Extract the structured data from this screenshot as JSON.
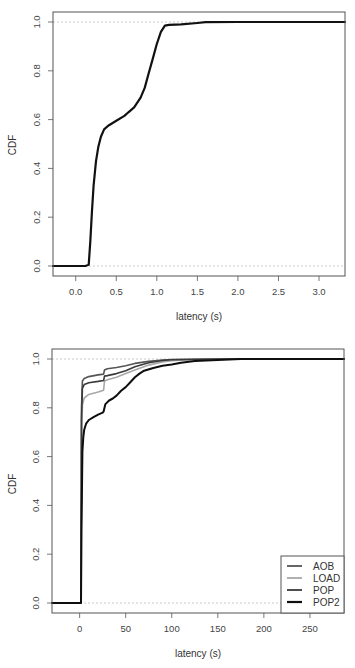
{
  "chart_data": [
    {
      "type": "line",
      "title": "",
      "xlabel": "latency (s)",
      "ylabel": "CDF",
      "xlim": [
        -0.28,
        3.32
      ],
      "ylim": [
        -0.04,
        1.04
      ],
      "xticks": [
        0.0,
        0.5,
        1.0,
        1.5,
        2.0,
        2.5,
        3.0
      ],
      "xtick_labels": [
        "0.0",
        "0.5",
        "1.0",
        "1.5",
        "2.0",
        "2.5",
        "3.0"
      ],
      "yticks": [
        0.0,
        0.2,
        0.4,
        0.6,
        0.8,
        1.0
      ],
      "ytick_labels": [
        "0.0",
        "0.2",
        "0.4",
        "0.6",
        "0.8",
        "1.0"
      ],
      "grid": false,
      "reference_lines": [
        0.0,
        1.0
      ],
      "legend": null,
      "series": [
        {
          "name": "CDF",
          "color": "#111111",
          "width": 2.2,
          "x": [
            -0.28,
            0.0,
            0.12,
            0.16,
            0.18,
            0.2,
            0.22,
            0.25,
            0.28,
            0.31,
            0.35,
            0.4,
            0.5,
            0.6,
            0.65,
            0.72,
            0.8,
            0.85,
            0.9,
            0.95,
            1.0,
            1.05,
            1.1,
            1.15,
            1.3,
            1.5,
            1.6,
            2.0,
            3.32
          ],
          "y": [
            0.0,
            0.0,
            0.0,
            0.005,
            0.1,
            0.22,
            0.33,
            0.43,
            0.49,
            0.53,
            0.56,
            0.575,
            0.595,
            0.615,
            0.63,
            0.65,
            0.69,
            0.73,
            0.79,
            0.85,
            0.91,
            0.96,
            0.985,
            0.988,
            0.99,
            0.996,
            0.999,
            1.0,
            1.0
          ]
        }
      ]
    },
    {
      "type": "line",
      "title": "",
      "xlabel": "latency (s)",
      "ylabel": "CDF",
      "xlim": [
        -30,
        287
      ],
      "ylim": [
        -0.04,
        1.04
      ],
      "xticks": [
        0,
        50,
        100,
        150,
        200,
        250
      ],
      "xtick_labels": [
        "0",
        "50",
        "100",
        "150",
        "200",
        "250"
      ],
      "yticks": [
        0.0,
        0.2,
        0.4,
        0.6,
        0.8,
        1.0
      ],
      "ytick_labels": [
        "0.0",
        "0.2",
        "0.4",
        "0.6",
        "0.8",
        "1.0"
      ],
      "grid": false,
      "reference_lines": [
        0.0,
        1.0
      ],
      "legend": {
        "position": "bottom-right",
        "entries": [
          "AOB",
          "LOAD",
          "POP",
          "POP2"
        ]
      },
      "series": [
        {
          "name": "AOB",
          "color": "#555555",
          "width": 1.6,
          "x": [
            -30,
            1.5,
            2,
            3,
            5,
            10,
            20,
            26,
            27,
            30,
            40,
            50,
            60,
            75,
            90,
            100,
            150,
            287
          ],
          "y": [
            0.0,
            0.0,
            0.8,
            0.91,
            0.92,
            0.928,
            0.935,
            0.938,
            0.955,
            0.96,
            0.965,
            0.972,
            0.982,
            0.99,
            0.996,
            0.998,
            1.0,
            1.0
          ]
        },
        {
          "name": "LOAD",
          "color": "#a8a8a8",
          "width": 1.6,
          "x": [
            -30,
            1.5,
            2,
            3,
            5,
            10,
            20,
            26,
            27,
            30,
            40,
            50,
            60,
            75,
            90,
            100,
            120,
            150,
            287
          ],
          "y": [
            0.0,
            0.0,
            0.7,
            0.81,
            0.84,
            0.855,
            0.865,
            0.872,
            0.91,
            0.915,
            0.925,
            0.94,
            0.955,
            0.975,
            0.988,
            0.993,
            0.997,
            1.0,
            1.0
          ]
        },
        {
          "name": "POP",
          "color": "#3a3a3a",
          "width": 1.6,
          "x": [
            -30,
            1.5,
            2,
            3,
            5,
            10,
            20,
            26,
            27,
            30,
            40,
            50,
            60,
            75,
            90,
            100,
            150,
            287
          ],
          "y": [
            0.0,
            0.0,
            0.75,
            0.88,
            0.895,
            0.903,
            0.908,
            0.912,
            0.93,
            0.932,
            0.94,
            0.952,
            0.968,
            0.985,
            0.994,
            0.997,
            1.0,
            1.0
          ]
        },
        {
          "name": "POP2",
          "color": "#0e0e0e",
          "width": 2.0,
          "x": [
            -30,
            1.5,
            2,
            3,
            4,
            5,
            7,
            10,
            15,
            20,
            25,
            26,
            28,
            32,
            36,
            40,
            45,
            50,
            55,
            60,
            65,
            70,
            80,
            90,
            100,
            110,
            125,
            150,
            175,
            287
          ],
          "y": [
            0.0,
            0.0,
            0.3,
            0.62,
            0.68,
            0.71,
            0.735,
            0.75,
            0.762,
            0.772,
            0.78,
            0.785,
            0.815,
            0.83,
            0.838,
            0.85,
            0.87,
            0.885,
            0.905,
            0.925,
            0.94,
            0.952,
            0.963,
            0.972,
            0.978,
            0.985,
            0.992,
            0.996,
            1.0,
            1.0
          ]
        }
      ]
    }
  ],
  "charts": {
    "top": {
      "ylabel": "CDF",
      "xlabel": "latency (s)"
    },
    "bottom": {
      "ylabel": "CDF",
      "xlabel": "latency (s)",
      "legend": [
        {
          "label": "AOB",
          "color": "#555555"
        },
        {
          "label": "LOAD",
          "color": "#a8a8a8"
        },
        {
          "label": "POP",
          "color": "#3a3a3a"
        },
        {
          "label": "POP2",
          "color": "#0e0e0e"
        }
      ]
    }
  },
  "layout": {
    "top": {
      "plot_left": 53,
      "plot_right": 345,
      "plot_top": 12,
      "plot_bottom": 276,
      "y0_px": 266,
      "y1_px": 22
    },
    "bottom": {
      "plot_left": 52,
      "plot_right": 344,
      "plot_top": 15,
      "plot_bottom": 279,
      "y0_px": 269,
      "y1_px": 25
    }
  }
}
